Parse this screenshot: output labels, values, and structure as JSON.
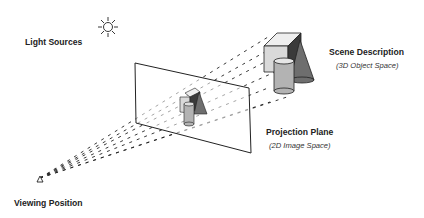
{
  "labels": {
    "light_sources": "Light Sources",
    "scene_description": "Scene Description",
    "scene_description_sub": "(3D Object Space)",
    "projection_plane": "Projection Plane",
    "projection_plane_sub": "(2D Image Space)",
    "viewing_position": "Viewing Position"
  },
  "icons": {
    "light": "sun-icon",
    "viewer": "triangle-eye-icon"
  },
  "colors": {
    "line": "#1a1a1a",
    "cube_front": "#d9d9d9",
    "cube_top": "#eeeeee",
    "cube_side": "#3a3a3a",
    "cylinder": "#b3b3b3",
    "cone": "#6e6e6e"
  }
}
